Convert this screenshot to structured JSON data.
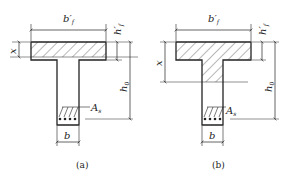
{
  "figures": [
    {
      "id": "a",
      "caption": "(a)",
      "labels": {
        "flange_width": "b′",
        "flange_width_sub": "f",
        "flange_thickness": "h′",
        "flange_thickness_sub": "f",
        "effective_depth": "h",
        "effective_depth_sub": "0",
        "compression_depth": "x",
        "steel_area": "A",
        "steel_area_sub": "s",
        "web_width": "b"
      },
      "neutral_axis_location": "in flange"
    },
    {
      "id": "b",
      "caption": "(b)",
      "labels": {
        "flange_width": "b′",
        "flange_width_sub": "f",
        "flange_thickness": "h′",
        "flange_thickness_sub": "f",
        "effective_depth": "h",
        "effective_depth_sub": "0",
        "compression_depth": "x",
        "steel_area": "A",
        "steel_area_sub": "s",
        "web_width": "b"
      },
      "neutral_axis_location": "in web"
    }
  ],
  "colors": {
    "line": "#222222",
    "background": "#ffffff"
  }
}
